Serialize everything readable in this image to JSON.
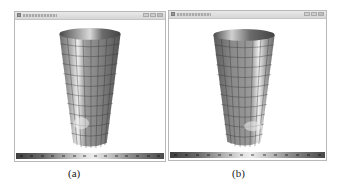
{
  "figure": {
    "panels": [
      {
        "id": "a",
        "caption": "(a)",
        "window": {
          "controls": [
            "minimize",
            "maximize",
            "close"
          ],
          "icon": "app-icon"
        },
        "viewport": {
          "object": "tapered-cylinder-mesh",
          "highlight_side": "left"
        },
        "colorbar": {
          "gradient": [
            "#3f3f3f",
            "#a7a7a7",
            "#ececec",
            "#8a8a8a",
            "#4a4a4a"
          ],
          "tick_count": 14
        }
      },
      {
        "id": "b",
        "caption": "(b)",
        "window": {
          "controls": [
            "minimize",
            "maximize",
            "close"
          ],
          "icon": "app-icon"
        },
        "viewport": {
          "object": "tapered-cylinder-mesh",
          "highlight_side": "right"
        },
        "colorbar": {
          "gradient": [
            "#3f3f3f",
            "#a7a7a7",
            "#ececec",
            "#8a8a8a",
            "#4a4a4a"
          ],
          "tick_count": 14
        }
      }
    ],
    "colors": {
      "frame": "#b8b8b8",
      "titlebar": "#dedede",
      "mesh_base": "#8c8c8c",
      "mesh_grid": "#3a3a3a",
      "background": "#ffffff"
    }
  }
}
